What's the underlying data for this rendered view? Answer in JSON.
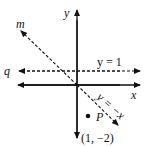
{
  "diagram": {
    "axes": {
      "x_label": "x",
      "y_label": "y"
    },
    "lines": {
      "m_label": "m",
      "q_label": "q",
      "horizontal_eq": "y = 1",
      "diagonal_eq": "y = −x"
    },
    "point": {
      "label": "P",
      "coords": "(1, −2)"
    },
    "colors": {
      "ink": "#111111",
      "background": "#ffffff"
    }
  }
}
